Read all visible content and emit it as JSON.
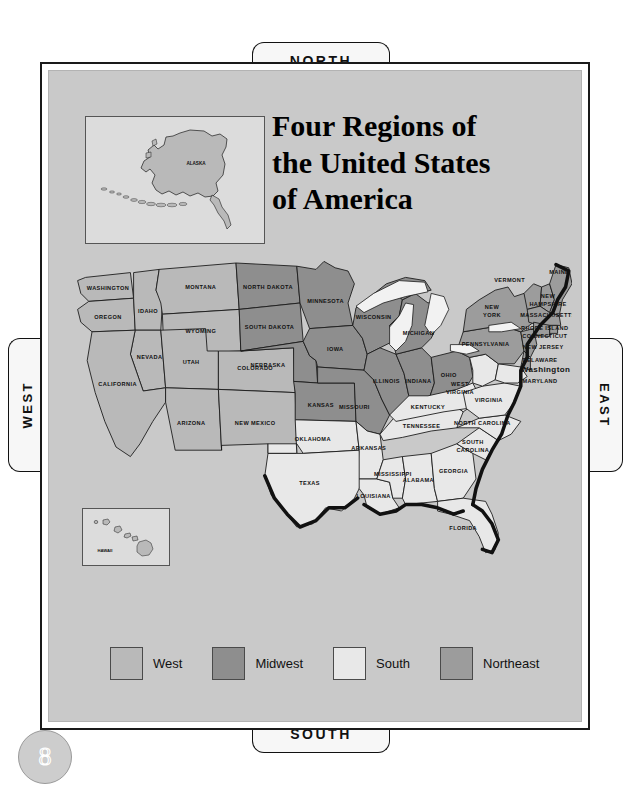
{
  "page": {
    "number": "8"
  },
  "title": {
    "line1": "Four Regions of",
    "line2": "the United States",
    "line3": "of America"
  },
  "compass": {
    "north": "NORTH",
    "south": "SOUTH",
    "west": "WEST",
    "east": "EAST"
  },
  "insets": {
    "alaska": {
      "label": "ALASKA"
    },
    "hawaii": {
      "label": "HAWAII"
    }
  },
  "legend": {
    "items": [
      {
        "label": "West",
        "color": "#b9b9b9"
      },
      {
        "label": "Midwest",
        "color": "#8e8e8e"
      },
      {
        "label": "South",
        "color": "#e8e8e8"
      },
      {
        "label": "Northeast",
        "color": "#9c9c9c"
      }
    ]
  },
  "map": {
    "regions": {
      "west": {
        "name": "West",
        "color": "#b9b9b9"
      },
      "midwest": {
        "name": "Midwest",
        "color": "#8e8e8e"
      },
      "south": {
        "name": "South",
        "color": "#e8e8e8"
      },
      "northeast": {
        "name": "Northeast",
        "color": "#9c9c9c"
      }
    },
    "labels": {
      "washington": "WASHINGTON",
      "oregon": "OREGON",
      "idaho": "IDAHO",
      "montana": "MONTANA",
      "wyoming": "WYOMING",
      "nevada": "NEVADA",
      "utah": "UTAH",
      "colorado": "COLORADO",
      "california": "CALIFORNIA",
      "arizona": "ARIZONA",
      "new_mexico": "NEW MEXICO",
      "north_dakota": "NORTH DAKOTA",
      "south_dakota": "SOUTH DAKOTA",
      "nebraska": "NEBRASKA",
      "kansas": "KANSAS",
      "minnesota": "MINNESOTA",
      "iowa": "IOWA",
      "missouri": "MISSOURI",
      "wisconsin": "WISCONSIN",
      "illinois": "ILLINOIS",
      "indiana": "INDIANA",
      "michigan": "MICHIGAN",
      "ohio": "OHIO",
      "oklahoma": "OKLAHOMA",
      "texas": "TEXAS",
      "arkansas": "ARKANSAS",
      "louisiana": "LOUISIANA",
      "mississippi": "MISSISSIPPI",
      "alabama": "ALABAMA",
      "tennessee": "TENNESSEE",
      "kentucky": "KENTUCKY",
      "georgia": "GEORGIA",
      "florida": "FLORIDA",
      "south_carolina_1": "SOUTH",
      "south_carolina_2": "CAROLINA",
      "north_carolina": "NORTH CAROLINA",
      "virginia": "VIRGINIA",
      "west_virginia_1": "WEST",
      "west_virginia_2": "VIRGINIA",
      "maryland": "MARYLAND",
      "delaware": "DELAWARE",
      "washington_dc": "Washington D.C.",
      "new_jersey": "NEW JERSEY",
      "pennsylvania": "PENNSYLVANIA",
      "new_york_1": "NEW",
      "new_york_2": "YORK",
      "connecticut": "CONNECTICUT",
      "rhode_island": "RHODE ISLAND",
      "massachusetts": "MASSACHUSETTS",
      "new_hampshire_1": "NEW",
      "new_hampshire_2": "HAMPSHIRE",
      "vermont": "VERMONT",
      "maine": "MAINE"
    }
  }
}
